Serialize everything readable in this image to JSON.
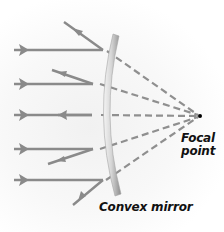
{
  "diagram": {
    "labels": {
      "focal_line1": "Focal",
      "focal_line2": "point",
      "mirror": "Convex mirror"
    },
    "colors": {
      "ray": "#8a8a8a",
      "dash": "#8f8f8f",
      "mirror_light": "#e6e6e6",
      "mirror_dark": "#9a9a9a",
      "focal_dot": "#000000",
      "text": "#111111"
    },
    "focal_point": {
      "x": 200,
      "y": 116
    },
    "incident_rays": [
      {
        "y": 50,
        "x_start": 14,
        "x_hit": 103,
        "reflect_to": [
          64,
          22
        ]
      },
      {
        "y": 84,
        "x_start": 14,
        "x_hit": 93,
        "reflect_to": [
          52,
          70
        ]
      },
      {
        "y": 115,
        "x_start": 14,
        "x_hit": 92,
        "reflect_to": [
          60,
          115
        ]
      },
      {
        "y": 149,
        "x_start": 14,
        "x_hit": 93,
        "reflect_to": [
          48,
          164
        ]
      },
      {
        "y": 180,
        "x_start": 14,
        "x_hit": 103,
        "reflect_to": [
          73,
          205
        ]
      }
    ]
  }
}
